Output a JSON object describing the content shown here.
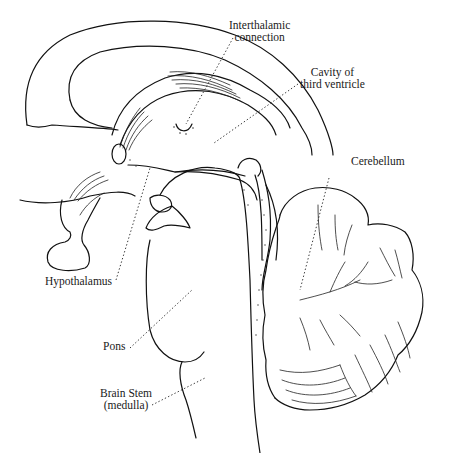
{
  "diagram": {
    "labels": [
      {
        "id": "interthalamic",
        "lines": [
          "Interthalamic",
          "connection"
        ]
      },
      {
        "id": "third-ventricle",
        "lines": [
          "Cavity of",
          "third ventricle"
        ]
      },
      {
        "id": "cerebellum",
        "lines": [
          "Cerebellum"
        ]
      },
      {
        "id": "hypothalamus",
        "lines": [
          "Hypothalamus"
        ]
      },
      {
        "id": "pons",
        "lines": [
          "Pons"
        ]
      },
      {
        "id": "brain-stem",
        "lines": [
          "Brain Stem",
          "(medulla)"
        ]
      }
    ],
    "colors": {
      "ink": "#111111",
      "background": "#ffffff"
    }
  }
}
